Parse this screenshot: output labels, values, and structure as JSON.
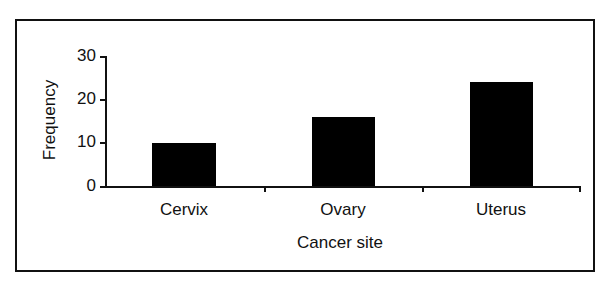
{
  "chart_data": {
    "type": "bar",
    "title": "",
    "xlabel": "Cancer site",
    "ylabel": "Frequency",
    "categories": [
      "Cervix",
      "Ovary",
      "Uterus"
    ],
    "values": [
      10,
      16,
      24
    ],
    "ylim": [
      0,
      30
    ],
    "yticks": [
      "0",
      "10",
      "20",
      "30"
    ],
    "grid": false,
    "legend": null,
    "bar_color": "#000000"
  }
}
